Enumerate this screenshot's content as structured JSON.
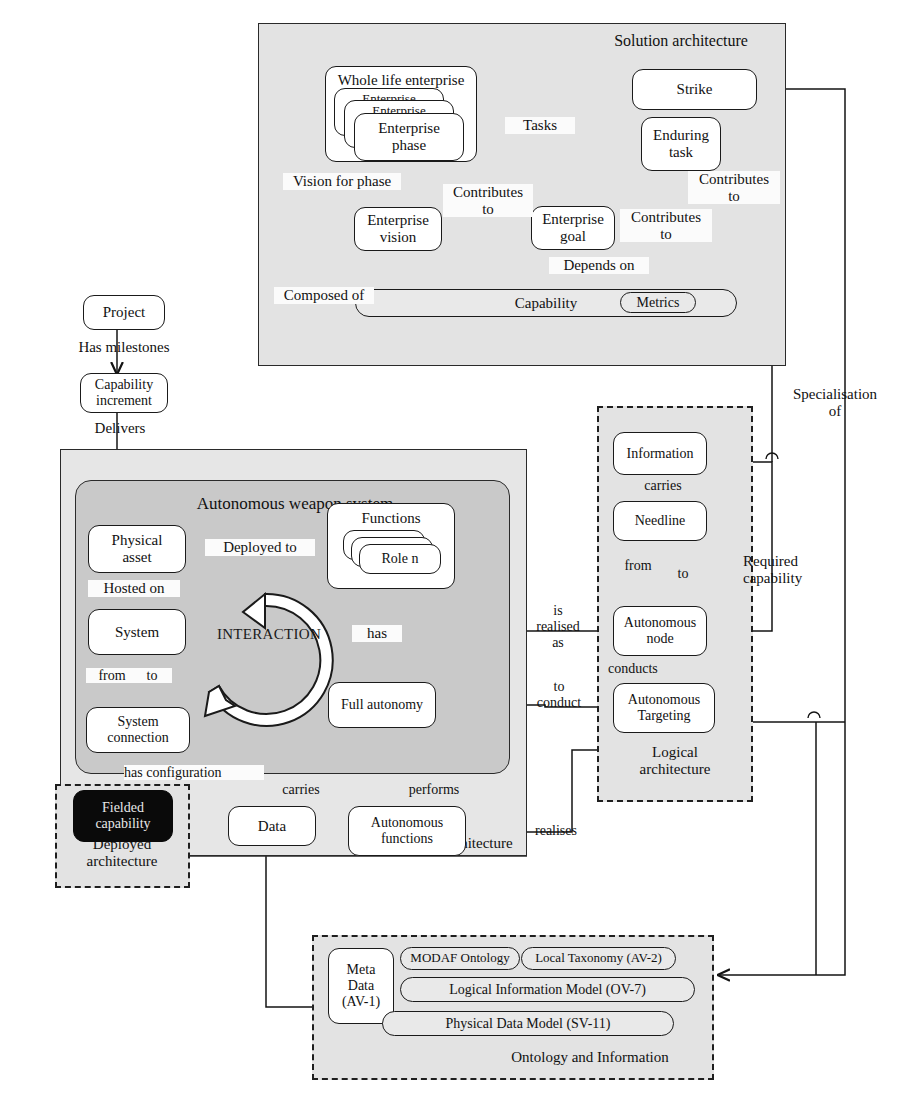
{
  "diagram": {
    "zones": [
      {
        "id": "solution_top",
        "label": "Solution architecture"
      },
      {
        "id": "aws",
        "label": "Autonomous weapon system"
      },
      {
        "id": "solution_bottom",
        "label": "Solution architecture"
      },
      {
        "id": "deployed",
        "label": "Deployed\narchitecture"
      },
      {
        "id": "logical",
        "label": "Logical\narchitecture"
      },
      {
        "id": "ontology",
        "label": "Ontology and Information"
      }
    ],
    "nodes": {
      "whole_life_enterprise": "Whole life enterprise",
      "enterprise_phase": "Enterprise\nphase",
      "enterprise_phase_stack2": "Enterprise",
      "enterprise_phase_stack1": "Enterprise",
      "enterprise_vision": "Enterprise\nvision",
      "enterprise_goal": "Enterprise\ngoal",
      "strike": "Strike",
      "enduring_task": "Enduring\ntask",
      "capability": "Capability",
      "metrics": "Metrics",
      "project": "Project",
      "capability_increment": "Capability\nincrement",
      "physical_asset": "Physical\nasset",
      "system": "System",
      "system_connection": "System\nconnection",
      "functions": "Functions",
      "role_n": "Role n",
      "full_autonomy": "Full autonomy",
      "data": "Data",
      "autonomous_functions": "Autonomous\nfunctions",
      "fielded_capability": "Fielded\ncapability",
      "information": "Information",
      "needline": "Needline",
      "autonomous_node": "Autonomous\nnode",
      "autonomous_targeting": "Autonomous\nTargeting",
      "meta_data": "Meta\nData\n(AV-1)",
      "modaf_ontology": "MODAF Ontology",
      "local_taxonomy": "Local Taxonomy (AV-2)",
      "logical_information_model": "Logical Information Model (OV-7)",
      "physical_data_model": "Physical Data Model (SV-11)"
    },
    "edge_labels": {
      "tasks": "Tasks",
      "vision_for_phase": "Vision for phase",
      "contributes_to_goal": "Contributes\nto",
      "contributes_to_task": "Contributes\nto",
      "contributes_to_strike": "Contributes\nto",
      "depends_on": "Depends on",
      "composed_of": "Composed of",
      "has_milestones": "Has milestones",
      "delivers": "Delivers",
      "deployed_to": "Deployed to",
      "hosted_on": "Hosted on",
      "from_left": "from",
      "to_left": "to",
      "has": "has",
      "carries_system": "carries",
      "performs": "performs",
      "has_configuration": "has configuration",
      "realises": "realises",
      "is_realised_as": "is\nrealised\nas",
      "to_conduct": "to\nconduct",
      "carries_needline": "carries",
      "from_needline": "from",
      "to_needline": "to",
      "conducts": "conducts",
      "required_capability": "Required\ncapability",
      "specialisation_of": "Specialisation\nof",
      "interaction": "INTERACTION"
    },
    "colors": {
      "zone_light": "#e3e3e3",
      "zone_dark": "#c9c9c9",
      "node_fill": "#ffffff",
      "node_fill_gray": "#e9e9e9",
      "node_black": "#0a0a0a",
      "stroke": "#1a1a1a"
    }
  }
}
